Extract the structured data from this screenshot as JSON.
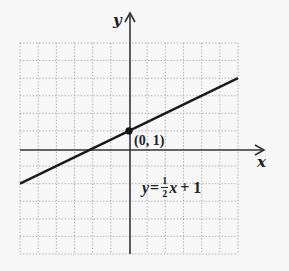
{
  "chart_data": {
    "type": "line",
    "title": "",
    "xlabel": "x",
    "ylabel": "y",
    "xlim": [
      -6,
      6
    ],
    "ylim": [
      -6,
      6
    ],
    "grid": true,
    "grid_style": "dotted",
    "series": [
      {
        "name": "y = 1/2 x + 1",
        "slope": 0.5,
        "intercept": 1,
        "x": [
          -6,
          6
        ],
        "y": [
          -2,
          4
        ]
      }
    ],
    "annotations": [
      {
        "type": "point",
        "x": 0,
        "y": 1,
        "label": "(0, 1)"
      },
      {
        "type": "text",
        "label": "y = 1/2 x + 1",
        "x": 0.7,
        "y": -2.5
      }
    ]
  },
  "labels": {
    "x_axis": "x",
    "y_axis": "y",
    "point": "(0, 1)",
    "equation": {
      "lhs": "y",
      "equals": "=",
      "frac_num": "1",
      "frac_den": "2",
      "var": "x",
      "rest": "+ 1"
    }
  },
  "colors": {
    "background": "#f7f7f7",
    "grid": "#9a9a9a",
    "axis": "#333333",
    "line": "#1a1a1a"
  }
}
